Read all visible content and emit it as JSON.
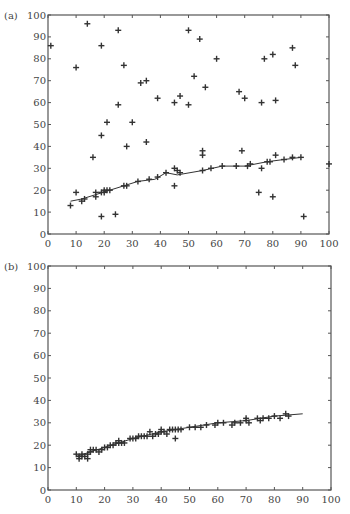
{
  "chart_data": [
    {
      "panel_label": "(a)",
      "type": "scatter",
      "xlim": [
        0,
        100
      ],
      "ylim": [
        0,
        100
      ],
      "xticks": [
        0,
        10,
        20,
        30,
        40,
        50,
        60,
        70,
        80,
        90,
        100
      ],
      "yticks": [
        0,
        10,
        20,
        30,
        40,
        50,
        60,
        70,
        80,
        90,
        100
      ],
      "grid": false,
      "marker": "+",
      "points": [
        [
          1,
          86
        ],
        [
          10,
          76
        ],
        [
          14,
          96
        ],
        [
          19,
          86
        ],
        [
          25,
          93
        ],
        [
          27,
          77
        ],
        [
          33,
          69
        ],
        [
          35,
          70
        ],
        [
          39,
          62
        ],
        [
          21,
          51
        ],
        [
          30,
          51
        ],
        [
          25,
          59
        ],
        [
          19,
          45
        ],
        [
          16,
          35
        ],
        [
          28,
          40
        ],
        [
          35,
          42
        ],
        [
          8,
          13
        ],
        [
          10,
          19
        ],
        [
          12,
          15
        ],
        [
          13,
          16
        ],
        [
          17,
          17
        ],
        [
          17,
          19
        ],
        [
          19,
          19
        ],
        [
          20,
          20
        ],
        [
          20,
          19
        ],
        [
          21,
          20
        ],
        [
          22,
          20
        ],
        [
          27,
          22
        ],
        [
          28,
          22
        ],
        [
          32,
          24
        ],
        [
          36,
          25
        ],
        [
          39,
          26
        ],
        [
          42,
          28
        ],
        [
          19,
          8
        ],
        [
          24,
          9
        ],
        [
          45,
          30
        ],
        [
          45,
          22
        ],
        [
          46,
          29
        ],
        [
          47,
          28
        ],
        [
          45,
          60
        ],
        [
          47,
          63
        ],
        [
          50,
          93
        ],
        [
          54,
          89
        ],
        [
          52,
          72
        ],
        [
          50,
          59
        ],
        [
          56,
          67
        ],
        [
          60,
          80
        ],
        [
          68,
          65
        ],
        [
          70,
          62
        ],
        [
          76,
          60
        ],
        [
          77,
          80
        ],
        [
          80,
          82
        ],
        [
          87,
          85
        ],
        [
          88,
          77
        ],
        [
          81,
          61
        ],
        [
          55,
          38
        ],
        [
          55,
          36
        ],
        [
          55,
          29
        ],
        [
          58,
          30
        ],
        [
          62,
          31
        ],
        [
          67,
          31
        ],
        [
          69,
          38
        ],
        [
          71,
          31
        ],
        [
          72,
          32
        ],
        [
          76,
          30
        ],
        [
          78,
          33
        ],
        [
          79,
          33
        ],
        [
          81,
          36
        ],
        [
          84,
          34
        ],
        [
          87,
          35
        ],
        [
          90,
          35
        ],
        [
          75,
          19
        ],
        [
          80,
          17
        ],
        [
          91,
          8
        ],
        [
          100,
          32
        ]
      ],
      "fit_line": [
        [
          8,
          15
        ],
        [
          12,
          16
        ],
        [
          17,
          18
        ],
        [
          22,
          20
        ],
        [
          27,
          22
        ],
        [
          32,
          24
        ],
        [
          38,
          25
        ],
        [
          42,
          28
        ],
        [
          46,
          27
        ],
        [
          55,
          29
        ],
        [
          62,
          31
        ],
        [
          70,
          31
        ],
        [
          78,
          33
        ],
        [
          84,
          34
        ],
        [
          90,
          35
        ]
      ]
    },
    {
      "panel_label": "(b)",
      "type": "scatter",
      "xlim": [
        0,
        100
      ],
      "ylim": [
        0,
        100
      ],
      "xticks": [
        0,
        10,
        20,
        30,
        40,
        50,
        60,
        70,
        80,
        90,
        100
      ],
      "yticks": [
        0,
        10,
        20,
        30,
        40,
        50,
        60,
        70,
        80,
        90,
        100
      ],
      "grid": false,
      "marker": "+",
      "points": [
        [
          10,
          16
        ],
        [
          11,
          15
        ],
        [
          11,
          14
        ],
        [
          12,
          15
        ],
        [
          12,
          16
        ],
        [
          13,
          15
        ],
        [
          14,
          14
        ],
        [
          14,
          16
        ],
        [
          15,
          17
        ],
        [
          15,
          18
        ],
        [
          16,
          18
        ],
        [
          17,
          18
        ],
        [
          18,
          17
        ],
        [
          19,
          18
        ],
        [
          20,
          19
        ],
        [
          21,
          19
        ],
        [
          22,
          20
        ],
        [
          23,
          20
        ],
        [
          24,
          21
        ],
        [
          25,
          22
        ],
        [
          25,
          21
        ],
        [
          26,
          21
        ],
        [
          27,
          21
        ],
        [
          29,
          23
        ],
        [
          30,
          23
        ],
        [
          31,
          23
        ],
        [
          32,
          24
        ],
        [
          33,
          24
        ],
        [
          34,
          24
        ],
        [
          35,
          24
        ],
        [
          36,
          26
        ],
        [
          37,
          24
        ],
        [
          38,
          25
        ],
        [
          39,
          25
        ],
        [
          40,
          27
        ],
        [
          40,
          26
        ],
        [
          41,
          26
        ],
        [
          42,
          25
        ],
        [
          43,
          27
        ],
        [
          44,
          27
        ],
        [
          45,
          23
        ],
        [
          45,
          27
        ],
        [
          46,
          27
        ],
        [
          47,
          27
        ],
        [
          50,
          28
        ],
        [
          52,
          28
        ],
        [
          54,
          28
        ],
        [
          56,
          29
        ],
        [
          59,
          29
        ],
        [
          60,
          30
        ],
        [
          62,
          30
        ],
        [
          65,
          29
        ],
        [
          66,
          30
        ],
        [
          68,
          30
        ],
        [
          70,
          31
        ],
        [
          71,
          30
        ],
        [
          70,
          32
        ],
        [
          74,
          32
        ],
        [
          75,
          31
        ],
        [
          76,
          32
        ],
        [
          78,
          32
        ],
        [
          80,
          33
        ],
        [
          82,
          32
        ],
        [
          84,
          34
        ],
        [
          85,
          33
        ]
      ],
      "fit_line": [
        [
          10,
          15
        ],
        [
          20,
          19
        ],
        [
          30,
          23
        ],
        [
          40,
          26
        ],
        [
          50,
          28
        ],
        [
          60,
          30
        ],
        [
          70,
          31
        ],
        [
          80,
          33
        ],
        [
          90,
          34
        ]
      ]
    }
  ]
}
